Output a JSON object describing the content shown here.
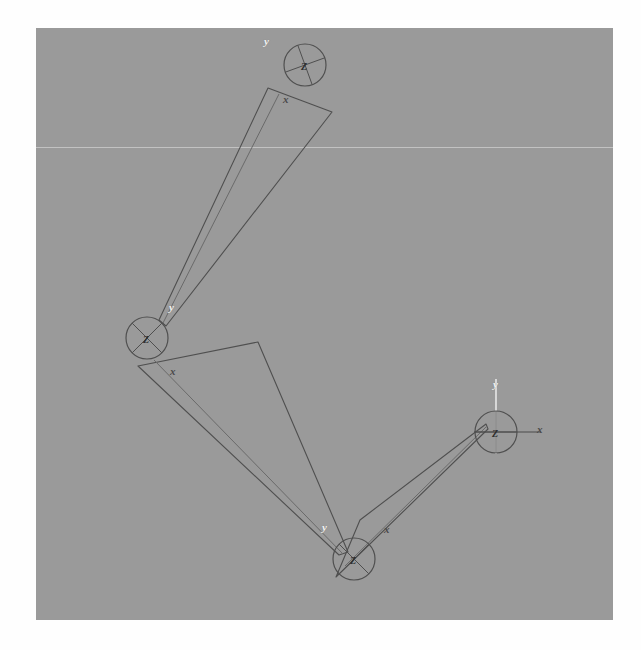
{
  "figure": {
    "type": "kinematic-chain-diagram",
    "title": "",
    "canvas": {
      "x": 36,
      "y": 28,
      "width": 577,
      "height": 592,
      "background_color": "#9a9a9a",
      "page_color": "#fefefe",
      "scanline_color": "#c9c9c9",
      "scanline_y": 119
    },
    "stroke_color": "#4f4f4f",
    "stroke_color_light": "#6a6a6a",
    "axis_y_color": "#f2f2f2",
    "axis_x_color": "#4a4a4a"
  },
  "joints": [
    {
      "id": "joint-1",
      "z_label": "Z",
      "y_label": "y",
      "x_label": "x",
      "cx": 269,
      "cy": 37,
      "r": 21,
      "z_text_x": 265,
      "z_text_y": 33,
      "y_text_x": 228,
      "y_text_y": 8,
      "x_text_x": 247,
      "x_text_y": 66,
      "spoke_angles": [
        20,
        110,
        200,
        290
      ]
    },
    {
      "id": "joint-2",
      "z_label": "Z",
      "y_label": "y",
      "x_label": "x",
      "cx": 111,
      "cy": 310,
      "r": 21,
      "z_text_x": 107,
      "z_text_y": 306,
      "y_text_x": 133,
      "y_text_y": 274,
      "x_text_x": 134,
      "x_text_y": 338,
      "spoke_angles": [
        45,
        135,
        225,
        315
      ]
    },
    {
      "id": "joint-3",
      "z_label": "Z",
      "y_label": "y",
      "x_label": "x",
      "cx": 318,
      "cy": 531,
      "r": 21,
      "z_text_x": 314,
      "z_text_y": 527,
      "y_text_x": 286,
      "y_text_y": 494,
      "x_text_x": 348,
      "x_text_y": 496,
      "spoke_angles": [
        45,
        135,
        225,
        315
      ]
    },
    {
      "id": "joint-4",
      "z_label": "Z",
      "y_label": "y",
      "x_label": "x",
      "cx": 460,
      "cy": 404,
      "r": 21,
      "z_text_x": 456,
      "z_text_y": 400,
      "y_text_x": 457,
      "y_text_y": 351,
      "x_text_x": 501,
      "x_text_y": 396,
      "spoke_angles": [
        0,
        90,
        180,
        270
      ]
    }
  ],
  "links": [
    {
      "id": "link-1",
      "from_joint": "joint-1",
      "to_joint": "joint-2",
      "outline": "M 232,60 L 296,84 L 130,298 L 123,292 Z",
      "inner": "M 243,66 L 127,295"
    },
    {
      "id": "link-2",
      "from_joint": "joint-2",
      "to_joint": "joint-3",
      "outline": "M 102,338 L 222,314 L 312,524 L 303,527 Z",
      "inner": "M 118,332 L 307,526"
    },
    {
      "id": "link-3",
      "from_joint": "joint-3",
      "to_joint": "joint-4",
      "outline": "M 300,549 L 324,492 L 450,396 L 452,401 Z",
      "inner": "M 309,538 L 450,399"
    }
  ]
}
